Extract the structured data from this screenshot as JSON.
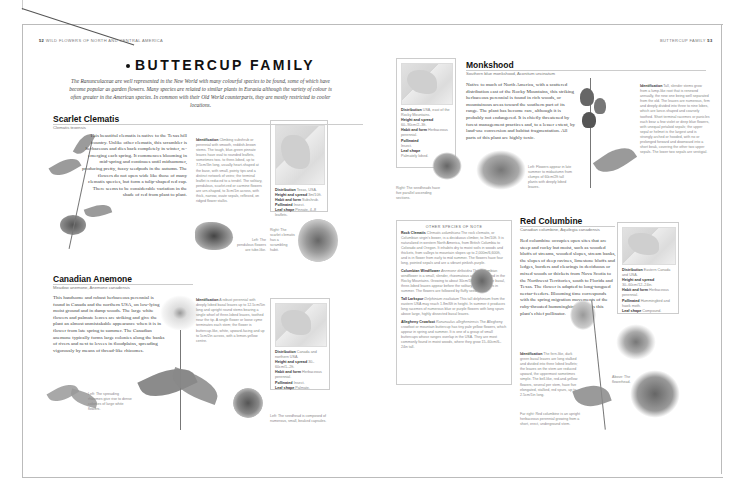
{
  "left_page": {
    "header": {
      "page_number": "52",
      "running_title": "WILD FLOWERS OF NORTH AND CENTRAL AMERICA"
    },
    "title": "BUTTERCUP FAMILY",
    "intro": "The Ranunculaceae are well represented in the New World with many colourful species to be found, some of which have become popular as garden flowers. Many species are related to similar plants in Eurasia although the variety of colour is often greater in the American species. In common with their Old World counterparts, they are mostly restricted to cooler locations.",
    "scarlet_clematis": {
      "name": "Scarlet Clematis",
      "latin": "Clematis texensis",
      "body": "This beautiful clematis is native to the Texas hill country. Unlike other clematis, this scrambler is herbaceous and dies back completely in winter, re-emerging each spring. It commences blooming in mid-spring and continues until midsummer, producing pretty, fuzzy seedpods in the autumn. The flowers do not open wide like those of many clematis species, but form a tulip-shaped red cup. There seems to be considerable variation in the shade of red from plant to plant.",
      "identification_label": "Identification",
      "identification": "Climbing subshrub or perennial with smooth, reddish-brown stems. The tough, blue-green pinnate leaves have oval to rounded leaflets, sometimes two- to three-lobed, up to 7.5cm/3in long, usually heart-shaped at the base, with small, pointy tips and a distinct network of veins; the terminal leaflet is reduced to a tendril. The solitary, pendulous, scarlet-red or carmine flowers are urn-shaped, to 3cm/1in across, with thick, narrow, ovate sepals, reflexed, on ridged flower stalks.",
      "caption_left": "Left: The pendulous flowers are tube-like.",
      "caption_right": "Right: The scarlet clematis has a scrambling habit.",
      "infobox": {
        "distribution_label": "Distribution",
        "distribution": "Texas, USA.",
        "height_label": "Height and spread",
        "height": "3m/10ft.",
        "habit_label": "Habit and form",
        "habit": "Subshrub.",
        "pollinated_label": "Pollinated",
        "pollinated": "Insect.",
        "leaf_label": "Leaf shape",
        "leaf": "Pinnate, 4–8 leaflets."
      }
    },
    "canadian_anemone": {
      "name": "Canadian Anemone",
      "latin": "Meadow anemone, Anemone canadensis",
      "body": "This handsome and robust herbaceous perennial is found in Canada and the northern USA, on low-lying moist ground and in damp woods. The large white flowers and palmate leaves are striking and give the plant an almost unmistakable appearance when it is in flower from late spring to summer. The Canadian anemone typically forms large colonies along the banks of rivers and next to levees in floodplains, spreading vigorously by means of thread-like rhizomes.",
      "identification_label": "Identification",
      "identification": "A robust perennial with deeply lobed basal leaves up to 12.5cm/5in long and upright round stems bearing a single whorl of three-lobed leaves, toothed near the tip. A single flower or loose cyme terminates each stem; the flower is buttercup-like, white, upward-facing and up to 5cm/2in across, with a lemon-yellow centre.",
      "caption_left": "Left: The spreading rhizomes give rise to dense colonies of large white flowers.",
      "caption_seed": "Left: The seedhead is composed of numerous, small, beaked capsules.",
      "infobox": {
        "distribution_label": "Distribution",
        "distribution": "Canada and northern USA.",
        "height_label": "Height and spread",
        "height": "30–60cm/1–2ft.",
        "habit_label": "Habit and form",
        "habit": "Herbaceous perennial.",
        "pollinated_label": "Pollinated",
        "pollinated": "Insect.",
        "leaf_label": "Leaf shape",
        "leaf": "Palmate."
      }
    }
  },
  "right_page": {
    "header": {
      "running_title": "BUTTERCUP FAMILY",
      "page_number": "53"
    },
    "monkshood": {
      "name": "Monkshood",
      "latin": "Southern blue monkshood, Aconitum uncinatum",
      "body": "Native to much of North America, with a scattered distribution east of the Rocky Mountains, this striking herbaceous perennial is found in rich woods, or mountainous areas toward the southern part of its range. The plant has become rare, although it is probably not endangered. It is chiefly threatened by forest management practices and, to a lesser extent, by land-use conversion and habitat fragmentation. All parts of this plant are highly toxic.",
      "identification_label": "Identification",
      "identification": "Tall, slender stems grow from a lump-like root that is renewed annually, the new one being well separated from the old. The leaves are numerous, firm and deeply divided into three to nine lobes, which are lance-shaped and coarsely toothed. Short terminal racemes or panicles each bear a few violet or deep blue flowers, with unequal petaloid sepals; the upper sepal or helmet is the largest and is strongly arched or hooded, with no or prolonged forward and downward into a short beak, covering the other two upper sepals. The lower two sepals are vestigial.",
      "caption_left": "Left: Flowers appear in late summer to midautumn from clumps of 60cm/2ft tall plants with deeply lobed leaves.",
      "caption_right": "Right: The seedheads have five parallel ascending sections.",
      "infobox": {
        "distribution_label": "Distribution",
        "distribution": "USA, east of the Rocky Mountains.",
        "height_label": "Height and spread",
        "height": "60–90cm/2–3ft.",
        "habit_label": "Habit and form",
        "habit": "Herbaceous perennial.",
        "pollinated_label": "Pollinated",
        "pollinated": "Insect.",
        "leaf_label": "Leaf shape",
        "leaf": "Palmately lobed."
      }
    },
    "other_species": {
      "title": "OTHER SPECIES OF NOTE",
      "items": [
        {
          "name": "Rock Clematis",
          "latin": "Clematis columbiana",
          "text": "The rock clematis, or Columbian virgin's bower, is a deciduous climber, to 3m/10ft. It is naturalized in western North America, from British Columbia to Colorado and Oregon. It inhabits dry to moist soils in woods and thickets, from valleys to mountain slopes up to 2,000m/6,600ft, and is in flower from early to mid summer. The flowers have four long, pointed sepals and are a vibrant pinkish-purple."
        },
        {
          "name": "Columbian Windflower",
          "latin": "Anemone deltoidea",
          "text": "The Columbian windflower is a small, slender, rhizomatous anemone found in the Rocky Mountains. Growing to about 30cm/1ft in height, the basal, three-lobed leaves appear before the solitary white flowers in summer. The flowers are followed by fluffy seedheads."
        },
        {
          "name": "Tall Larkspur",
          "latin": "Delphinium exaltatum",
          "text": "This tall delphinium from the eastern USA may reach 1.8m/6ft in height. In summer it produces long racemes of numerous blue or purple flowers with long spurs above large, highly dissected basal leaves."
        },
        {
          "name": "Allegheny Crowfoot",
          "latin": "Ranunculus allegheniensis",
          "text": "The Allegheny crowfoot or mountain buttercup has tiny pale yellow flowers, which appear in spring and summer. It is one of a group of small buttercups whose ranges overlap in the USA. They are most commonly found in moist woods, where they grow 15–60cm/6–24in tall."
        }
      ]
    },
    "red_columbine": {
      "name": "Red Columbine",
      "latin": "Canadian columbine, Aquilegia canadensis",
      "body": "Red columbine occupies open sites that are steep and rocky but moist, such as wooded bluffs of streams, wooded slopes, stream banks, the slopes of deep ravines, limestone bluffs and ledges, borders and clearings in deciduous or mixed woods or thickets from Nova Scotia to the Northwest Territories, south to Florida and Texas. The flower is adapted to long-tongued nectar-feeders. Blooming time corresponds with the spring migration movements of the ruby-throated hummingbird, which is this plant's chief pollinator.",
      "identification_label": "Identification",
      "identification": "The fern-like, dark green basal leaves are long stalked and divided into three lobed leaflets; the leaves on the stem are reduced upward, the uppermost sometimes simple. The bell-like, red-and-yellow flowers, several per stem, have five elongated, stalked, red spurs, up to 2.5cm/1in long.",
      "caption_far_right": "Far right: Red columbine is an upright herbaceous perennial growing from a short, erect, underground stem.",
      "caption_above": "Above: The flowerhead.",
      "infobox": {
        "distribution_label": "Distribution",
        "distribution": "Eastern Canada and USA.",
        "height_label": "Height and spread",
        "height": "30–60cm/12–24in.",
        "habit_label": "Habit and form",
        "habit": "Herbaceous perennial.",
        "pollinated_label": "Pollinated",
        "pollinated": "Hummingbird and hawk moth.",
        "leaf_label": "Leaf shape",
        "leaf": "Compound."
      }
    }
  },
  "colors": {
    "text": "#333333",
    "muted": "#888888",
    "rule": "#cccccc",
    "frame": "#bbbbbb"
  }
}
